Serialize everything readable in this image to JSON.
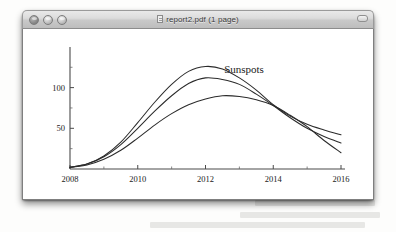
{
  "window": {
    "title": "report2.pdf (1 page)",
    "doc_icon": "document-icon",
    "traffic_lights": [
      {
        "name": "close",
        "label": "Close"
      },
      {
        "name": "minimize",
        "label": "Minimize"
      },
      {
        "name": "zoom",
        "label": "Zoom"
      }
    ],
    "toolbar_toggle_label": "Toggle Toolbar"
  },
  "chart_data": {
    "type": "line",
    "title": "",
    "annotations": [
      {
        "text": "Sunspots",
        "x": 2012.55,
        "y": 118
      }
    ],
    "xlabel": "",
    "ylabel": "",
    "xlim": [
      2008,
      2016
    ],
    "ylim": [
      0,
      145
    ],
    "grid": false,
    "legend": "none",
    "xticks": [
      2008,
      2010,
      2012,
      2014,
      2016
    ],
    "xtick_labels": [
      "2008",
      "2010",
      "2012",
      "2014",
      "2016"
    ],
    "xminor_ticks": [
      2009,
      2011,
      2013,
      2015
    ],
    "yticks": [
      50,
      100
    ],
    "ytick_labels": [
      "50",
      "100"
    ],
    "yminor_ticks": [
      25,
      75,
      125
    ],
    "x": [
      2008,
      2008.5,
      2009,
      2009.5,
      2010,
      2010.5,
      2011,
      2011.5,
      2012,
      2012.5,
      2013,
      2013.5,
      2014,
      2014.5,
      2015,
      2015.5,
      2016
    ],
    "series": [
      {
        "name": "upper",
        "values": [
          2,
          6,
          16,
          33,
          57,
          82,
          104,
          120,
          126,
          123,
          112,
          97,
          79,
          65,
          55,
          48,
          42
        ]
      },
      {
        "name": "middle",
        "values": [
          2,
          6,
          15,
          30,
          50,
          71,
          90,
          105,
          112,
          110,
          104,
          92,
          78,
          63,
          50,
          40,
          32
        ]
      },
      {
        "name": "lower",
        "values": [
          2,
          5,
          12,
          23,
          38,
          54,
          68,
          79,
          86,
          90,
          89,
          85,
          78,
          66,
          52,
          35,
          20
        ]
      }
    ]
  }
}
